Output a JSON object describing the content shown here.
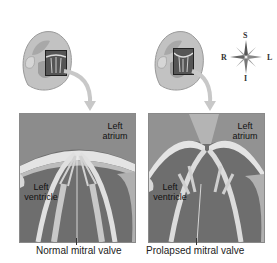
{
  "figure": {
    "panels": [
      {
        "id": "normal",
        "labels": {
          "atrium": "Left\natrium",
          "ventricle": "Left\nventricle"
        },
        "atrium_line1": "Left",
        "atrium_line2": "atrium",
        "ventricle_line1": "Left",
        "ventricle_line2": "ventricle",
        "caption": "Normal mitral valve"
      },
      {
        "id": "prolapsed",
        "atrium_line1": "Left",
        "atrium_line2": "atrium",
        "ventricle_line1": "Left",
        "ventricle_line2": "ventricle",
        "caption": "Prolapsed mitral valve"
      }
    ],
    "compass": {
      "top": "S",
      "bottom": "I",
      "left": "R",
      "right": "L"
    }
  },
  "colors": {
    "background": "#ffffff",
    "heart_gray": "#b8b8b8",
    "panel_dark": "#555555",
    "valve_light": "#e6e6e6",
    "arrow": "#c8c8c8"
  }
}
